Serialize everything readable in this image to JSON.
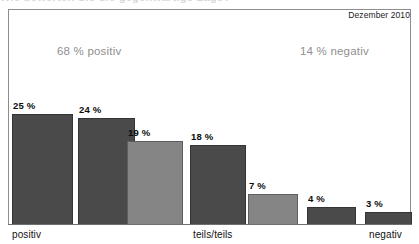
{
  "header": {
    "cropped_title_remnant": "Wie bewerten Sie die gegenwärtige Lage?",
    "date_badge": "Dezember 2010"
  },
  "annotations": {
    "positive_summary": "68 % positiv",
    "negative_summary": "14 % negativ"
  },
  "axis_labels": {
    "left": "positiv",
    "middle": "teils/teils",
    "right": "negativ"
  },
  "colors": {
    "bar_dark": "#4a4a4a",
    "bar_light": "#858585",
    "frame": "#8d8d8d",
    "annotation_text": "#8f8f8f"
  },
  "chart_data": {
    "type": "bar",
    "title": "Wie bewerten Sie die gegenwärtige Lage?",
    "subtitle": "Dezember 2010",
    "xlabel": "",
    "ylabel": "",
    "ylim": [
      0,
      28
    ],
    "grid": false,
    "legend": "none",
    "categories": [
      "positiv",
      "",
      "",
      "teils/teils",
      "",
      "",
      "negativ"
    ],
    "values": [
      25,
      24,
      19,
      18,
      7,
      4,
      3
    ],
    "value_labels": [
      "25 %",
      "24 %",
      "19 %",
      "18 %",
      "7 %",
      "4 %",
      "3 %"
    ],
    "bar_shades": [
      "dark",
      "dark",
      "light",
      "dark",
      "light",
      "dark",
      "dark"
    ],
    "annotations": [
      {
        "text": "68 % positiv",
        "covers_bars": [
          0,
          1,
          2
        ],
        "sum": 68
      },
      {
        "text": "14 % negativ",
        "covers_bars": [
          4,
          5,
          6
        ],
        "sum": 14
      }
    ],
    "bars": [
      {
        "label": "25 %",
        "value": 25,
        "shade": "dark",
        "x": 12,
        "width": 61
      },
      {
        "label": "24 %",
        "value": 24,
        "shade": "dark",
        "x": 78,
        "width": 57
      },
      {
        "label": "19 %",
        "value": 19,
        "shade": "light",
        "x": 127,
        "width": 56
      },
      {
        "label": "18 %",
        "value": 18,
        "shade": "dark",
        "x": 190,
        "width": 56
      },
      {
        "label": "7 %",
        "value": 7,
        "shade": "light",
        "x": 248,
        "width": 50
      },
      {
        "label": "4 %",
        "value": 4,
        "shade": "dark",
        "x": 307,
        "width": 49
      },
      {
        "label": "3 %",
        "value": 3,
        "shade": "dark",
        "x": 365,
        "width": 47
      }
    ]
  }
}
